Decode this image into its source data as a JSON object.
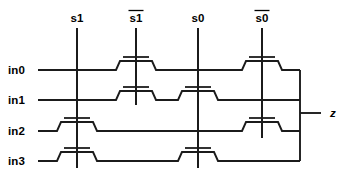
{
  "diagram": {
    "type": "transistor-level schematic"
  },
  "inputs": [
    {
      "id": "in0",
      "label": "in0",
      "y": 70
    },
    {
      "id": "in1",
      "label": "in1",
      "y": 100
    },
    {
      "id": "in2",
      "label": "in2",
      "y": 131
    },
    {
      "id": "in3",
      "label": "in3",
      "y": 161
    }
  ],
  "output": {
    "id": "z",
    "label": "z",
    "y": 113,
    "bus_x": 300
  },
  "selects": [
    {
      "id": "s1",
      "label": "s1",
      "overbar": false,
      "x": 77,
      "top": 28,
      "bottom": 168
    },
    {
      "id": "s1b",
      "label": "s1",
      "overbar": true,
      "x": 136,
      "top": 28,
      "bottom": 105
    },
    {
      "id": "s0",
      "label": "s0",
      "overbar": false,
      "x": 198,
      "top": 28,
      "bottom": 168
    },
    {
      "id": "s0b",
      "label": "s0",
      "overbar": true,
      "x": 262,
      "top": 28,
      "bottom": 138
    }
  ],
  "transistors": [
    {
      "id": "t-s1b-in0",
      "gate": "s1b",
      "row": "in0",
      "x": 136,
      "y": 70
    },
    {
      "id": "t-s0b-in0",
      "gate": "s0b",
      "row": "in0",
      "x": 262,
      "y": 70
    },
    {
      "id": "t-s1b-in1",
      "gate": "s1b",
      "row": "in1",
      "x": 136,
      "y": 100
    },
    {
      "id": "t-s0-in1",
      "gate": "s0",
      "row": "in1",
      "x": 198,
      "y": 100
    },
    {
      "id": "t-s1-in2",
      "gate": "s1",
      "row": "in2",
      "x": 77,
      "y": 131
    },
    {
      "id": "t-s0b-in2",
      "gate": "s0b",
      "row": "in2",
      "x": 262,
      "y": 131
    },
    {
      "id": "t-s1-in3",
      "gate": "s1",
      "row": "in3",
      "x": 77,
      "y": 161
    },
    {
      "id": "t-s0-in3",
      "gate": "s0",
      "row": "in3",
      "x": 198,
      "y": 161
    }
  ],
  "geometry": {
    "wire_start_x": 38,
    "step_rise": 9,
    "step_half_width": 16,
    "step_ramp": 4,
    "gate_bar_half": 13,
    "gate_gap": 4,
    "label_x": 8,
    "select_label_y": 22,
    "output_label_x": 330
  },
  "colors": {
    "ink": "#1b1b1b",
    "text": "#000000",
    "background": "#ffffff"
  }
}
